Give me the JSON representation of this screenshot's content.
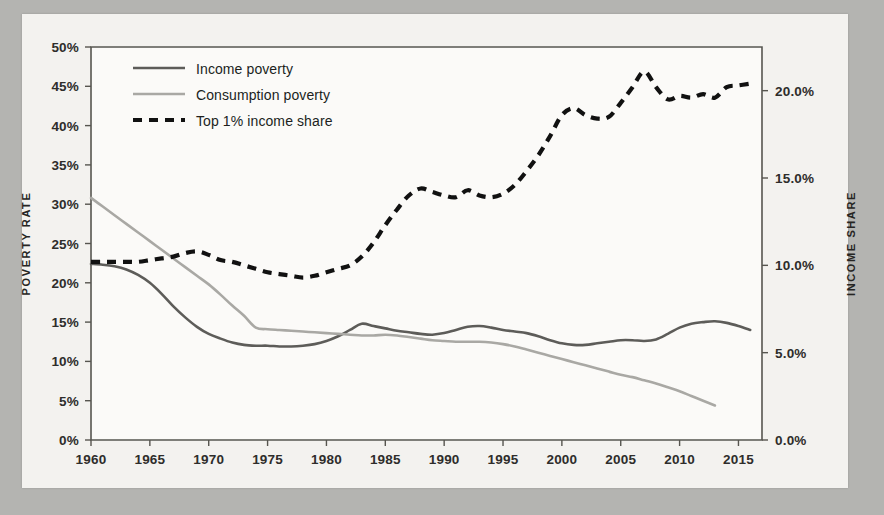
{
  "figure": {
    "background_color": "#b4b4b1",
    "paper_color": "#f3f2ef",
    "ink_color": "#2e2d2b"
  },
  "axes": {
    "left": {
      "title": "POVERTY RATE",
      "ticks": [
        "0%",
        "5%",
        "10%",
        "15%",
        "20%",
        "25%",
        "30%",
        "35%",
        "40%",
        "45%",
        "50%"
      ],
      "min": 0,
      "max": 50
    },
    "right": {
      "title": "INCOME SHARE",
      "ticks": [
        "0.0%",
        "5.0%",
        "10.0%",
        "15.0%",
        "20.0%"
      ],
      "min": 0,
      "max": 22.5
    },
    "bottom": {
      "ticks": [
        "1960",
        "1965",
        "1970",
        "1975",
        "1980",
        "1985",
        "1990",
        "1995",
        "2000",
        "2005",
        "2010",
        "2015"
      ],
      "min": 1960,
      "max": 2017
    }
  },
  "legend": {
    "position": "top-left-inside",
    "items": [
      {
        "label": "Income poverty",
        "style": "solid",
        "color": "#5d5c59"
      },
      {
        "label": "Consumption poverty",
        "style": "solid",
        "color": "#a9a8a4"
      },
      {
        "label": "Top 1% income share",
        "style": "dashed",
        "color": "#111111"
      }
    ]
  },
  "bleed_text": [
    {
      "text": "from the other side of the page",
      "x": 210,
      "y": 118,
      "size": 14
    },
    {
      "text": "faint show-through",
      "x": 305,
      "y": 150,
      "size": 13
    },
    {
      "text": "ghosted line of type",
      "x": 235,
      "y": 240,
      "size": 13
    },
    {
      "text": "another faint line",
      "x": 500,
      "y": 250,
      "size": 13
    }
  ],
  "chart_data": {
    "type": "line",
    "title": "",
    "xlabel": "",
    "ylabel": "POVERTY RATE",
    "y2label": "INCOME SHARE",
    "xlim": [
      1960,
      2017
    ],
    "ylim": [
      0,
      50
    ],
    "y2lim": [
      0,
      22.5
    ],
    "grid": false,
    "legend_position": "upper left",
    "x": [
      1960,
      1961,
      1962,
      1963,
      1964,
      1965,
      1966,
      1967,
      1968,
      1969,
      1970,
      1971,
      1972,
      1973,
      1974,
      1975,
      1976,
      1977,
      1978,
      1979,
      1980,
      1981,
      1982,
      1983,
      1984,
      1985,
      1986,
      1987,
      1988,
      1989,
      1990,
      1991,
      1992,
      1993,
      1994,
      1995,
      1996,
      1997,
      1998,
      1999,
      2000,
      2001,
      2002,
      2003,
      2004,
      2005,
      2006,
      2007,
      2008,
      2009,
      2010,
      2011,
      2012,
      2013,
      2014,
      2015,
      2016
    ],
    "series": [
      {
        "name": "Income poverty",
        "axis": "left",
        "unit": "%",
        "color": "#5d5c59",
        "style": "solid",
        "values": [
          22.4,
          22.3,
          22.1,
          21.7,
          21.0,
          20.0,
          18.6,
          17.0,
          15.6,
          14.4,
          13.5,
          12.9,
          12.4,
          12.1,
          12.0,
          12.0,
          11.9,
          11.9,
          12.0,
          12.2,
          12.6,
          13.2,
          14.0,
          14.8,
          14.5,
          14.2,
          13.9,
          13.7,
          13.5,
          13.4,
          13.6,
          14.0,
          14.4,
          14.5,
          14.3,
          14.0,
          13.8,
          13.6,
          13.2,
          12.7,
          12.3,
          12.1,
          12.1,
          12.3,
          12.5,
          12.7,
          12.7,
          12.6,
          12.8,
          13.5,
          14.3,
          14.8,
          15.0,
          15.1,
          14.9,
          14.5,
          14.0
        ]
      },
      {
        "name": "Consumption poverty",
        "axis": "left",
        "unit": "%",
        "color": "#a9a8a4",
        "style": "solid",
        "values": [
          30.8,
          29.7,
          28.6,
          27.5,
          26.4,
          25.3,
          24.2,
          23.1,
          22.0,
          20.9,
          19.8,
          18.5,
          17.1,
          15.8,
          14.3,
          14.1,
          14.0,
          13.9,
          13.8,
          13.7,
          13.6,
          13.5,
          13.4,
          13.3,
          13.3,
          13.4,
          13.3,
          13.1,
          12.9,
          12.7,
          12.6,
          12.5,
          12.5,
          12.5,
          12.4,
          12.2,
          11.9,
          11.5,
          11.1,
          10.7,
          10.3,
          9.9,
          9.5,
          9.1,
          8.7,
          8.3,
          8.0,
          7.6,
          7.2,
          6.7,
          6.2,
          5.6,
          5.0,
          4.4,
          null,
          null,
          null
        ]
      },
      {
        "name": "Top 1% income share",
        "axis": "right",
        "unit": "%",
        "color": "#111111",
        "style": "dashed",
        "values": [
          10.2,
          10.2,
          10.2,
          10.2,
          10.2,
          10.3,
          10.4,
          10.5,
          10.7,
          10.8,
          10.6,
          10.3,
          10.2,
          10.0,
          9.8,
          9.6,
          9.5,
          9.4,
          9.3,
          9.4,
          9.6,
          9.8,
          10.0,
          10.5,
          11.3,
          12.3,
          13.2,
          14.0,
          14.4,
          14.2,
          14.0,
          13.9,
          14.3,
          14.0,
          13.9,
          14.1,
          14.6,
          15.4,
          16.3,
          17.4,
          18.6,
          19.0,
          18.6,
          18.4,
          18.5,
          19.3,
          20.2,
          21.1,
          20.2,
          19.5,
          19.7,
          19.6,
          19.8,
          19.6,
          20.2,
          20.3,
          20.4
        ]
      }
    ]
  }
}
